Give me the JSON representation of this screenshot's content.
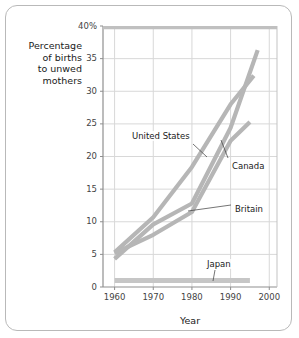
{
  "chart_data": {
    "type": "line",
    "title": "",
    "xlabel": "Year",
    "ylabel": "Percentage of births to unwed mothers",
    "xlim": [
      1957,
      2002
    ],
    "ylim": [
      0,
      40
    ],
    "grid": true,
    "legend_position": "inline-annotations",
    "xticks": [
      "1960",
      "1970",
      "1980",
      "1990",
      "2000"
    ],
    "xtick_values": [
      1960,
      1970,
      1980,
      1990,
      2000
    ],
    "yticks": [
      "0",
      "5",
      "10",
      "15",
      "20",
      "25",
      "30",
      "35",
      "40%"
    ],
    "ytick_values": [
      0,
      5,
      10,
      15,
      20,
      25,
      30,
      35,
      40
    ],
    "series": [
      {
        "name": "United States",
        "color": "#b6b6b6",
        "x": [
          1960,
          1970,
          1980,
          1990,
          1996
        ],
        "values": [
          5.3,
          10.7,
          18.4,
          28.0,
          32.4
        ]
      },
      {
        "name": "Canada",
        "color": "#b6b6b6",
        "x": [
          1960,
          1970,
          1980,
          1990,
          1997
        ],
        "values": [
          4.3,
          9.6,
          12.8,
          24.4,
          36.3
        ]
      },
      {
        "name": "Britain",
        "color": "#b6b6b6",
        "x": [
          1960,
          1970,
          1980,
          1990,
          1995
        ],
        "values": [
          5.2,
          8.0,
          11.5,
          22.4,
          25.3
        ]
      },
      {
        "name": "Japan",
        "color": "#c6c6c6",
        "x": [
          1960,
          1970,
          1980,
          1990,
          1995
        ],
        "values": [
          1.0,
          1.0,
          1.0,
          1.0,
          1.0
        ]
      }
    ],
    "annotations": [
      {
        "text": "United States",
        "x": 1972,
        "y": 23.0
      },
      {
        "text": "Canada",
        "x": 1993,
        "y": 18.4
      },
      {
        "text": "Britain",
        "x": 1993,
        "y": 11.8
      },
      {
        "text": "Japan",
        "x": 1985,
        "y": 3.4
      }
    ],
    "colors": {
      "grid": "#d8d8d8",
      "frame": "#a8a8a8",
      "text": "#1a1a1a",
      "tick_text": "#444444",
      "card_border": "#b9b9b9",
      "background": "#ffffff"
    }
  },
  "axis_titles": {
    "y": "Percentage\nof births\nto unwed\nmothers",
    "x": "Year"
  }
}
